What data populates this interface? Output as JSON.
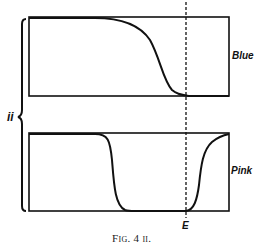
{
  "figure": {
    "caption": "Fig. 4 ii.",
    "group_label": "ii",
    "marker_label": "E",
    "panels": [
      {
        "label": "Blue",
        "description": "curve high on left, falls sharply, reaches baseline at line E and stays low"
      },
      {
        "label": "Pink",
        "description": "curve high on left, drops to baseline, stays low until line E, then rises sharply to top"
      }
    ],
    "colors": {
      "ink": "#111111",
      "background": "#ffffff"
    }
  }
}
